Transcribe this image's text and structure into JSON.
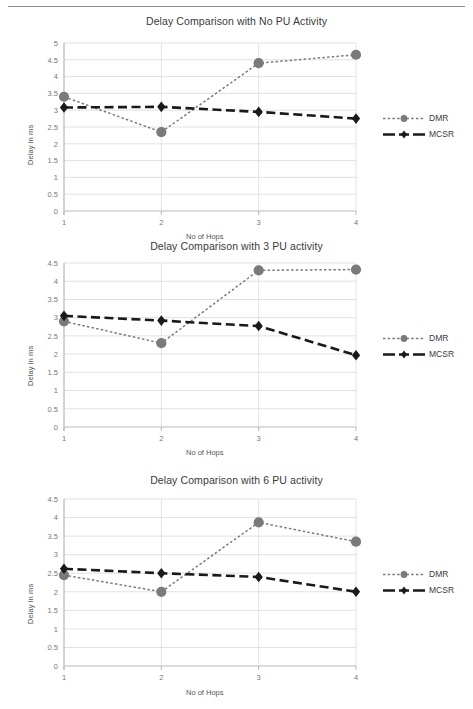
{
  "page": {
    "top_rule": "horizontal-rule"
  },
  "series_meta": {
    "dmr": {
      "name": "DMR",
      "color": "#7a7a7a",
      "marker": "circle",
      "line": "dotted"
    },
    "mcsr": {
      "name": "MCSR",
      "color": "#1a1a1a",
      "marker": "diamond",
      "line": "dashed"
    }
  },
  "chart_data": [
    {
      "type": "line",
      "id": "chart-no-pu",
      "title": "Delay Comparison with No PU Activity",
      "xlabel": "No of Hops",
      "ylabel": "Delay in ms",
      "categories": [
        "1",
        "2",
        "3",
        "4"
      ],
      "x": [
        1,
        2,
        3,
        4
      ],
      "xlim": [
        1,
        4
      ],
      "ylim": [
        0,
        5
      ],
      "yticks": [
        "0",
        "0.5",
        "1",
        "1.5",
        "2",
        "2.5",
        "3",
        "3.5",
        "4",
        "4.5",
        "5"
      ],
      "ytick_values": [
        0,
        0.5,
        1,
        1.5,
        2,
        2.5,
        3,
        3.5,
        4,
        4.5,
        5
      ],
      "grid": true,
      "legend_position": "right",
      "series": [
        {
          "name": "DMR",
          "values": [
            3.4,
            2.35,
            4.4,
            4.65
          ]
        },
        {
          "name": "MCSR",
          "values": [
            3.08,
            3.1,
            2.95,
            2.75
          ]
        }
      ]
    },
    {
      "type": "line",
      "id": "chart-3-pu",
      "title": "Delay Comparison with 3 PU activity",
      "xlabel": "No of Hops",
      "ylabel": "Delay in ms",
      "categories": [
        "1",
        "2",
        "3",
        "4"
      ],
      "x": [
        1,
        2,
        3,
        4
      ],
      "xlim": [
        1,
        4
      ],
      "ylim": [
        0,
        4.5
      ],
      "yticks": [
        "0",
        "0.5",
        "1",
        "1.5",
        "2",
        "2.5",
        "3",
        "3.5",
        "4",
        "4.5"
      ],
      "ytick_values": [
        0,
        0.5,
        1,
        1.5,
        2,
        2.5,
        3,
        3.5,
        4,
        4.5
      ],
      "grid": true,
      "legend_position": "right",
      "series": [
        {
          "name": "DMR",
          "values": [
            2.9,
            2.3,
            4.3,
            4.32
          ]
        },
        {
          "name": "MCSR",
          "values": [
            3.05,
            2.92,
            2.77,
            1.97
          ]
        }
      ]
    },
    {
      "type": "line",
      "id": "chart-6-pu",
      "title": "Delay Comparison with 6 PU activity",
      "xlabel": "No of Hops",
      "ylabel": "Delay in ms",
      "categories": [
        "1",
        "2",
        "3",
        "4"
      ],
      "x": [
        1,
        2,
        3,
        4
      ],
      "xlim": [
        1,
        4
      ],
      "ylim": [
        0,
        4.5
      ],
      "yticks": [
        "0",
        "0.5",
        "1",
        "1.5",
        "2",
        "2.5",
        "3",
        "3.5",
        "4",
        "4.5"
      ],
      "ytick_values": [
        0,
        0.5,
        1,
        1.5,
        2,
        2.5,
        3,
        3.5,
        4,
        4.5
      ],
      "grid": true,
      "legend_position": "right",
      "series": [
        {
          "name": "DMR",
          "values": [
            2.45,
            2.0,
            3.87,
            3.35
          ]
        },
        {
          "name": "MCSR",
          "values": [
            2.62,
            2.5,
            2.4,
            2.0
          ]
        }
      ]
    }
  ]
}
